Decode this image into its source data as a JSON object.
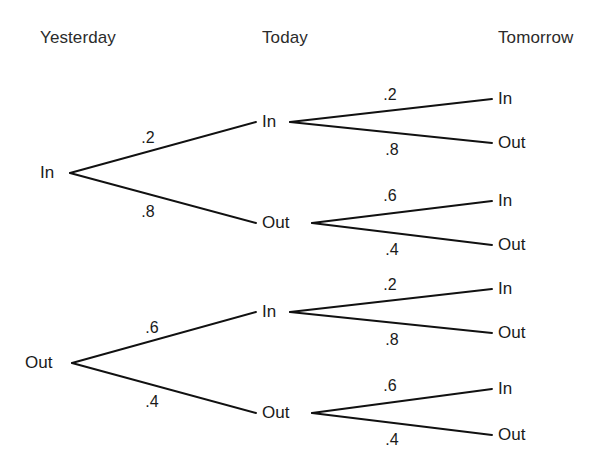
{
  "figure": {
    "type": "probability-tree-diagram",
    "width": 612,
    "height": 475,
    "background_color": "#ffffff",
    "line_color": "#111111"
  },
  "headers": [
    {
      "label": "Yesterday",
      "x": 40,
      "y": 40
    },
    {
      "label": "Today",
      "x": 262,
      "y": 40
    },
    {
      "label": "Tomorrow",
      "x": 498,
      "y": 40
    }
  ],
  "trees": [
    {
      "name": "yesterday-in",
      "root": {
        "label": "In",
        "x": 40,
        "y": 173,
        "vertex_x": 70,
        "anchor": "start"
      },
      "branches": [
        {
          "name": "in-to-in",
          "prob": ".2",
          "prob_x": 148,
          "prob_y": 138,
          "node": {
            "label": "In",
            "x": 262,
            "y": 122,
            "vertex_x": 290,
            "line_end_x": 256
          },
          "leaves": [
            {
              "name": "in-in-to-in",
              "prob": ".2",
              "prob_x": 390,
              "prob_y": 95,
              "label": "In",
              "x": 498,
              "y": 99,
              "line_end_x": 492
            },
            {
              "name": "in-in-to-out",
              "prob": ".8",
              "prob_x": 392,
              "prob_y": 150,
              "label": "Out",
              "x": 498,
              "y": 143,
              "line_end_x": 492
            }
          ]
        },
        {
          "name": "in-to-out",
          "prob": ".8",
          "prob_x": 148,
          "prob_y": 212,
          "node": {
            "label": "Out",
            "x": 262,
            "y": 223,
            "vertex_x": 312,
            "line_end_x": 256
          },
          "leaves": [
            {
              "name": "in-out-to-in",
              "prob": ".6",
              "prob_x": 390,
              "prob_y": 196,
              "label": "In",
              "x": 498,
              "y": 201,
              "line_end_x": 492
            },
            {
              "name": "in-out-to-out",
              "prob": ".4",
              "prob_x": 392,
              "prob_y": 250,
              "label": "Out",
              "x": 498,
              "y": 245,
              "line_end_x": 492
            }
          ]
        }
      ]
    },
    {
      "name": "yesterday-out",
      "root": {
        "label": "Out",
        "x": 25,
        "y": 363,
        "vertex_x": 72,
        "anchor": "start"
      },
      "branches": [
        {
          "name": "out-to-in",
          "prob": ".6",
          "prob_x": 152,
          "prob_y": 328,
          "node": {
            "label": "In",
            "x": 262,
            "y": 312,
            "vertex_x": 290,
            "line_end_x": 256
          },
          "leaves": [
            {
              "name": "out-in-to-in",
              "prob": ".2",
              "prob_x": 390,
              "prob_y": 285,
              "label": "In",
              "x": 498,
              "y": 289,
              "line_end_x": 492
            },
            {
              "name": "out-in-to-out",
              "prob": ".8",
              "prob_x": 392,
              "prob_y": 340,
              "label": "Out",
              "x": 498,
              "y": 333,
              "line_end_x": 492
            }
          ]
        },
        {
          "name": "out-to-out",
          "prob": ".4",
          "prob_x": 152,
          "prob_y": 402,
          "node": {
            "label": "Out",
            "x": 262,
            "y": 413,
            "vertex_x": 312,
            "line_end_x": 256
          },
          "leaves": [
            {
              "name": "out-out-to-in",
              "prob": ".6",
              "prob_x": 390,
              "prob_y": 386,
              "label": "In",
              "x": 498,
              "y": 389,
              "line_end_x": 492
            },
            {
              "name": "out-out-to-out",
              "prob": ".4",
              "prob_x": 392,
              "prob_y": 440,
              "label": "Out",
              "x": 498,
              "y": 435,
              "line_end_x": 492
            }
          ]
        }
      ]
    }
  ],
  "caption_fragments": {
    "top_cropped": "",
    "bottom_cropped": ""
  }
}
